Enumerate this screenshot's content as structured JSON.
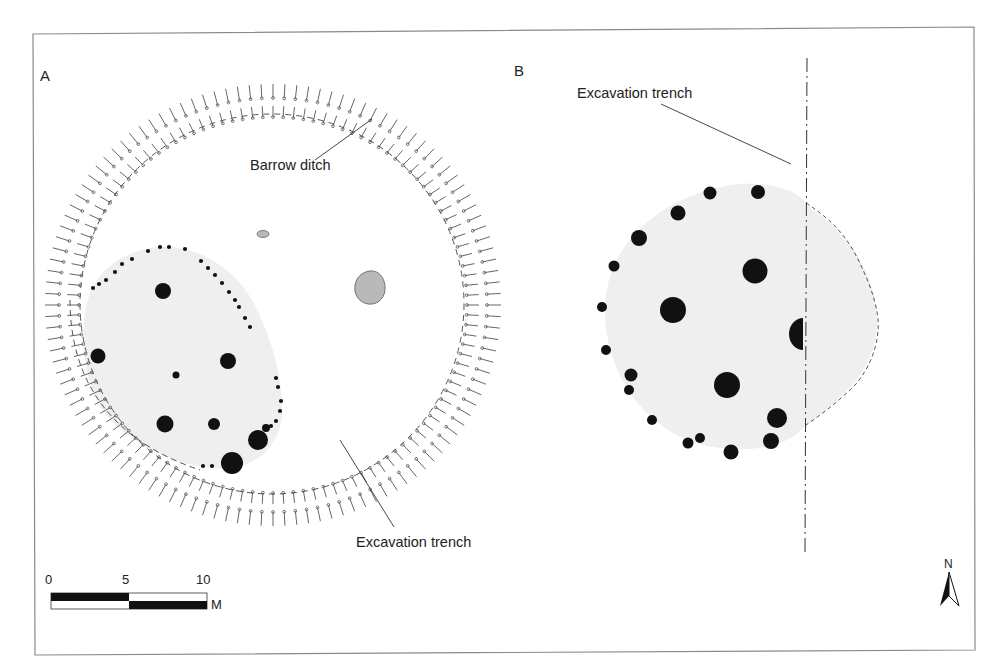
{
  "figure": {
    "panels": [
      {
        "id": "A",
        "label": "A",
        "annotations": {
          "barrow_ditch": "Barrow ditch",
          "excavation_trench": "Excavation trench"
        }
      },
      {
        "id": "B",
        "label": "B",
        "annotations": {
          "excavation_trench": "Excavation trench"
        }
      }
    ],
    "scale_bar": {
      "ticks": [
        "0",
        "5",
        "10"
      ],
      "unit": "M"
    },
    "north_arrow": {
      "label": "N"
    },
    "colors": {
      "frame": "#8a8a8a",
      "ink": "#111111",
      "house_fill": "#efefef",
      "pit_fill": "#b9b9b9",
      "hachure": "#555555"
    }
  }
}
